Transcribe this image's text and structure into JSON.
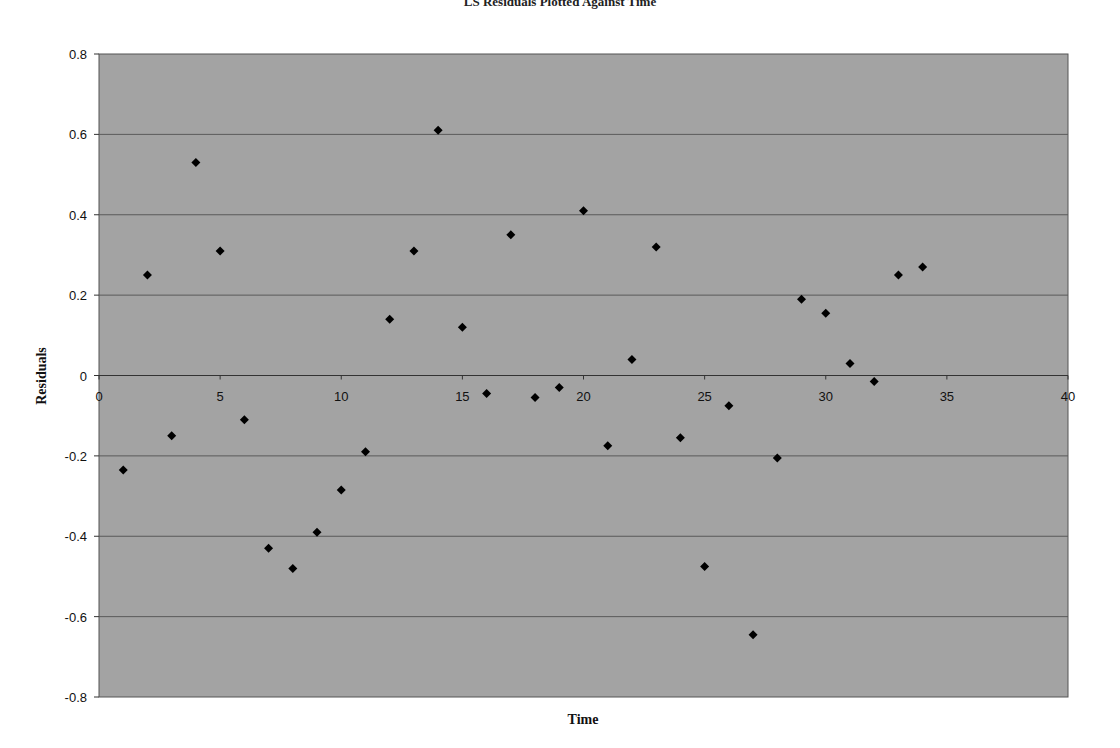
{
  "chart_data": {
    "type": "scatter",
    "title": "LS Residuals Plotted Against Time",
    "xlabel": "Time",
    "ylabel": "Residuals",
    "xlim": [
      0,
      40
    ],
    "ylim": [
      -0.8,
      0.8
    ],
    "x_ticks": [
      0,
      5,
      10,
      15,
      20,
      25,
      30,
      35,
      40
    ],
    "y_ticks": [
      -0.8,
      -0.6,
      -0.4,
      -0.2,
      0,
      0.2,
      0.4,
      0.6,
      0.8
    ],
    "y_tick_labels": [
      "-0.8",
      "-0.6",
      "-0.4",
      "-0.2",
      "0",
      "0.2",
      "0.4",
      "0.6",
      "0.8"
    ],
    "grid": {
      "horizontal": true,
      "vertical": false
    },
    "legend": null,
    "marker": "diamond",
    "plot_background": "#a3a3a3",
    "marker_color": "#000000",
    "series": [
      {
        "name": "Residuals",
        "x": [
          1,
          2,
          3,
          4,
          5,
          6,
          7,
          8,
          9,
          10,
          11,
          12,
          13,
          14,
          15,
          16,
          17,
          18,
          19,
          20,
          21,
          22,
          23,
          24,
          25,
          26,
          27,
          28,
          29,
          30,
          31,
          32,
          33,
          34
        ],
        "y": [
          -0.235,
          0.25,
          -0.15,
          0.53,
          0.31,
          -0.11,
          -0.43,
          -0.48,
          -0.39,
          -0.285,
          -0.19,
          0.14,
          0.31,
          0.61,
          0.12,
          -0.045,
          0.35,
          -0.055,
          -0.03,
          0.41,
          -0.175,
          0.04,
          0.32,
          -0.155,
          -0.475,
          -0.075,
          -0.645,
          -0.205,
          0.19,
          0.155,
          0.03,
          -0.015,
          0.25,
          0.27
        ]
      }
    ]
  }
}
